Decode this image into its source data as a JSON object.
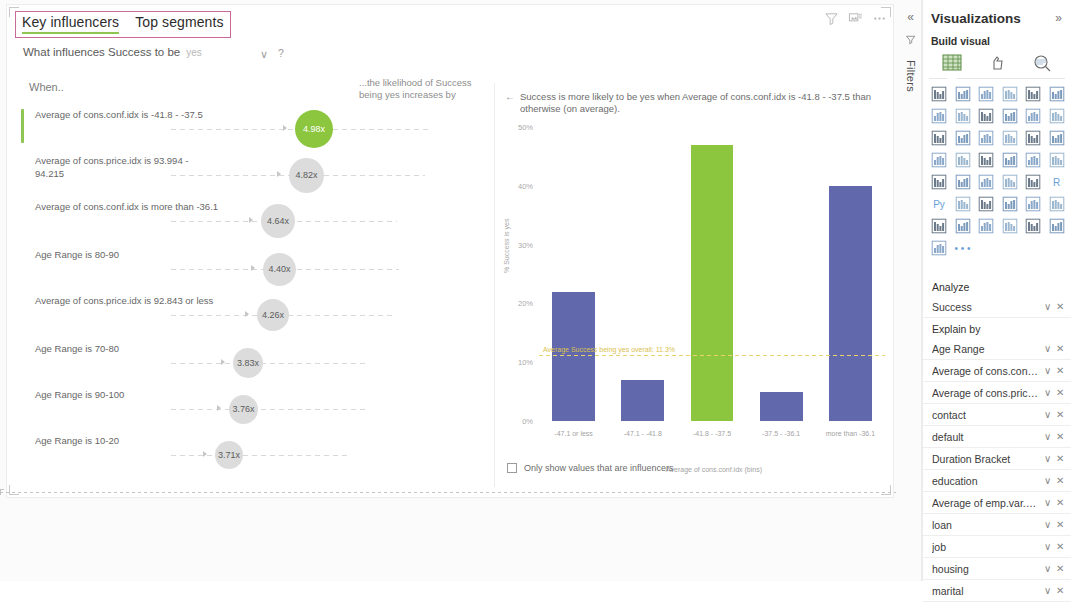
{
  "visual": {
    "tabs": [
      {
        "label": "Key influencers",
        "active": true
      },
      {
        "label": "Top segments",
        "active": false
      }
    ],
    "question": {
      "text": "What influences Success to be",
      "value": "yes",
      "chevron": "∨",
      "help": "?"
    },
    "header_icons": [
      "filter-icon",
      "focus-mode-icon",
      "more-options-icon"
    ],
    "when_label": "When..",
    "likelihood_label": "...the likelihood of Success being yes increases by",
    "influencers": [
      {
        "label": "Average of cons.conf.idx is -41.8 - -37.5",
        "value": "4.98x",
        "top": true,
        "size": 38
      },
      {
        "label": "Average of cons.price.idx is 93.994 - 94.215",
        "value": "4.82x",
        "top": false,
        "size": 35
      },
      {
        "label": "Average of cons.conf.idx is more than -36.1",
        "value": "4.64x",
        "top": false,
        "size": 34
      },
      {
        "label": "Age Range is 80-90",
        "value": "4.40x",
        "top": false,
        "size": 33
      },
      {
        "label": "Average of cons.price.idx is 92.843 or less",
        "value": "4.26x",
        "top": false,
        "size": 32
      },
      {
        "label": "Age Range is 70-80",
        "value": "3.83x",
        "top": false,
        "size": 30
      },
      {
        "label": "Age Range is 90-100",
        "value": "3.76x",
        "top": false,
        "size": 29
      },
      {
        "label": "Age Range is 10-20",
        "value": "3.71x",
        "top": false,
        "size": 28
      }
    ],
    "detail": {
      "back_arrow": "←",
      "headline": "Success is more likely to be yes when Average of cons.conf.idx is -41.8 - -37.5 than otherwise (on average).",
      "checkbox_label": "Only show values that are influencers",
      "checkbox_checked": false
    }
  },
  "chart_data": {
    "type": "bar",
    "title": "",
    "xlabel": "Average of cons.conf.idx (bins)",
    "ylabel": "% Success is yes",
    "categories": [
      "-47.1 or less",
      "-47.1 - -41.8",
      "-41.8 - -37.5",
      "-37.5 - -36.1",
      "more than -36.1"
    ],
    "values": [
      22,
      7,
      47,
      5,
      40
    ],
    "highlight_index": 2,
    "highlight_color": "#8cc63e",
    "bar_color": "#6168ab",
    "ylim": [
      0,
      50
    ],
    "yticks": [
      "0%",
      "10%",
      "20%",
      "30%",
      "40%",
      "50%"
    ],
    "ytick_values": [
      0,
      10,
      20,
      30,
      40,
      50
    ],
    "grid": false,
    "reference_line": {
      "value": 11.3,
      "label": "Average Success being yes overall: 11.3%",
      "color": "#e8d46a"
    }
  },
  "rail": {
    "collapse": "«",
    "filter_icon": "filter-pane-icon",
    "filters_label": "Filters"
  },
  "visualizations": {
    "title": "Visualizations",
    "expand": "»",
    "build_visual": "Build visual",
    "modes": [
      "build-visual-icon",
      "format-visual-icon",
      "analytics-icon"
    ],
    "gallery_icons": [
      "stacked-bar-chart",
      "stacked-column-chart",
      "clustered-bar-chart",
      "clustered-column-chart",
      "100-stacked-bar-chart",
      "100-stacked-column-chart",
      "line-chart",
      "area-chart",
      "stacked-area-chart",
      "line-stacked-column-chart",
      "line-clustered-column-chart",
      "ribbon-chart",
      "waterfall-chart",
      "funnel-chart",
      "scatter-chart",
      "pie-chart",
      "donut-chart",
      "treemap",
      "map",
      "filled-map",
      "shape-map",
      "azure-map",
      "gauge",
      "card",
      "multi-row-card",
      "kpi",
      "slicer",
      "table",
      "matrix",
      "r-script-visual",
      "python-visual",
      "key-influencers",
      "decomposition-tree",
      "q-and-a",
      "narrative",
      "smart-narrative",
      "paginated-report",
      "power-apps",
      "power-automate",
      "arcgis-map",
      "more-visuals-chevron",
      "get-more-visuals",
      "build-your-own-visual",
      "more-options-ellipsis"
    ],
    "gallery_text_icons": {
      "r-script-visual": "R",
      "python-visual": "Py",
      "more-options-ellipsis": "• • •"
    },
    "fields": {
      "analyze_label": "Analyze",
      "analyze_items": [
        {
          "name": "Success"
        }
      ],
      "explain_by_label": "Explain by",
      "explain_by_items": [
        {
          "name": "Age Range"
        },
        {
          "name": "Average of cons.conf.i..."
        },
        {
          "name": "Average of cons.price..."
        },
        {
          "name": "contact"
        },
        {
          "name": "default"
        },
        {
          "name": "Duration Bracket"
        },
        {
          "name": "education"
        },
        {
          "name": "Average of emp.var.ra..."
        },
        {
          "name": "loan"
        },
        {
          "name": "job"
        },
        {
          "name": "housing"
        },
        {
          "name": "marital"
        }
      ],
      "chevron": "∨",
      "remove": "✕"
    }
  }
}
